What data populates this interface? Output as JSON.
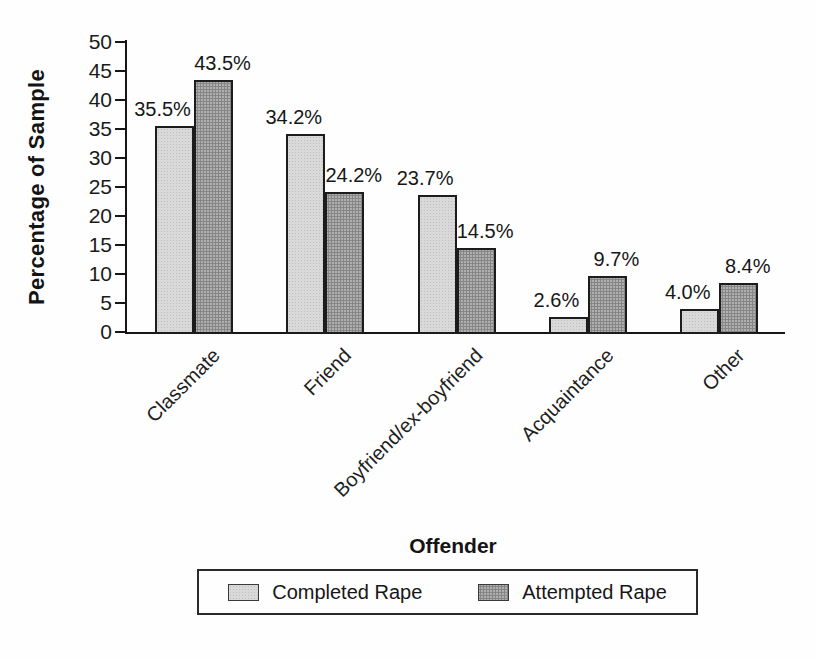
{
  "chart_data": {
    "type": "bar",
    "title": "",
    "xlabel": "Offender",
    "ylabel": "Percentage of Sample",
    "categories": [
      "Classmate",
      "Friend",
      "Boyfriend/ex-boyfriend",
      "Acquaintance",
      "Other"
    ],
    "series": [
      {
        "name": "Completed Rape",
        "values": [
          35.5,
          34.2,
          23.7,
          2.6,
          4.0
        ],
        "labels": [
          "35.5%",
          "34.2%",
          "23.7%",
          "2.6%",
          "4.0%"
        ],
        "color": "#d9d9d9"
      },
      {
        "name": "Attempted Rape",
        "values": [
          43.5,
          24.2,
          14.5,
          9.7,
          8.4
        ],
        "labels": [
          "43.5%",
          "24.2%",
          "14.5%",
          "9.7%",
          "8.4%"
        ],
        "color": "#a7a7a7"
      }
    ],
    "ylim": [
      0,
      50
    ],
    "ytick_step": 5,
    "yticks": [
      0,
      5,
      10,
      15,
      20,
      25,
      30,
      35,
      40,
      45,
      50
    ],
    "legend_position": "bottom",
    "grid": false
  }
}
